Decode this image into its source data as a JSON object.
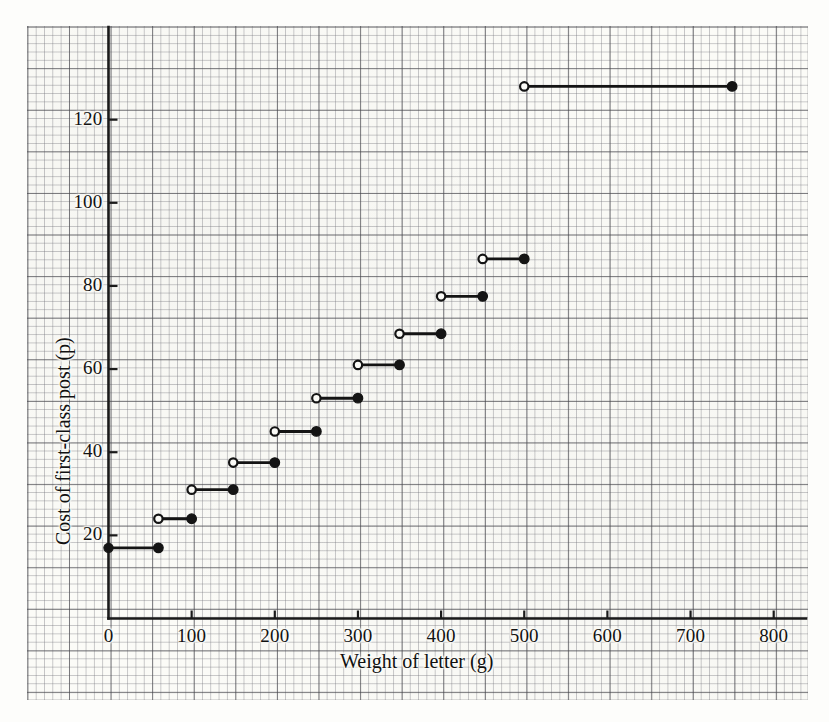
{
  "chart_data": {
    "type": "line",
    "title": "",
    "xlabel": "Weight of letter (g)",
    "ylabel": "Cost of first-class post (p)",
    "xlim": [
      0,
      840
    ],
    "ylim": [
      0,
      142
    ],
    "xticks": [
      0,
      100,
      200,
      300,
      400,
      500,
      600,
      700,
      800
    ],
    "xtick_labels": [
      "0",
      "100",
      "200",
      "300",
      "400",
      "500",
      "600",
      "700",
      "800"
    ],
    "yticks": [
      20,
      40,
      60,
      80,
      100,
      120
    ],
    "ytick_labels": [
      "20",
      "40",
      "60",
      "80",
      "100",
      "120"
    ],
    "grid": true,
    "grid_style": "graph-paper",
    "legend": "none",
    "step_style": "left-open-right-closed",
    "series_name": "Cost of first-class post",
    "steps": [
      {
        "x_start": 0,
        "x_end": 60,
        "y": 17,
        "start_marker": "closed",
        "end_marker": "closed"
      },
      {
        "x_start": 60,
        "x_end": 100,
        "y": 24,
        "start_marker": "open",
        "end_marker": "closed"
      },
      {
        "x_start": 100,
        "x_end": 150,
        "y": 31,
        "start_marker": "open",
        "end_marker": "closed"
      },
      {
        "x_start": 150,
        "x_end": 200,
        "y": 37.5,
        "start_marker": "open",
        "end_marker": "closed"
      },
      {
        "x_start": 200,
        "x_end": 250,
        "y": 45,
        "start_marker": "open",
        "end_marker": "closed"
      },
      {
        "x_start": 250,
        "x_end": 300,
        "y": 53,
        "start_marker": "open",
        "end_marker": "closed"
      },
      {
        "x_start": 300,
        "x_end": 350,
        "y": 61,
        "start_marker": "open",
        "end_marker": "closed"
      },
      {
        "x_start": 350,
        "x_end": 400,
        "y": 68.5,
        "start_marker": "open",
        "end_marker": "closed"
      },
      {
        "x_start": 400,
        "x_end": 450,
        "y": 77.5,
        "start_marker": "open",
        "end_marker": "closed"
      },
      {
        "x_start": 450,
        "x_end": 500,
        "y": 86.5,
        "start_marker": "open",
        "end_marker": "closed"
      },
      {
        "x_start": 500,
        "x_end": 750,
        "y": 128,
        "start_marker": "open",
        "end_marker": "closed"
      }
    ],
    "colors": {
      "line": "#141414",
      "axis": "#1a1a1a",
      "grid_major": "#46464b",
      "grid_minor": "#787880",
      "paper": "#fbfbf7"
    }
  }
}
